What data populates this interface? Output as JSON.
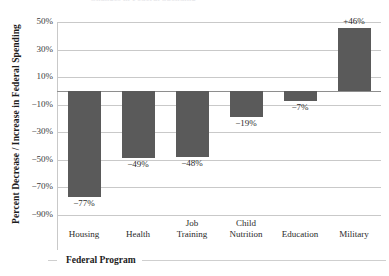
{
  "figure": {
    "cut_title_sliver": "Changes in Federal Spending",
    "background_color": "#ffffff",
    "bar_color": "#5a5a5a",
    "gridline_color": "#c9c9c9",
    "zero_line_color": "#8e8e8e"
  },
  "chart_data": {
    "type": "bar",
    "title": "",
    "xlabel": "Federal Program",
    "ylabel": "Percent Decrease / Increase in Federal Spending",
    "categories": [
      "Housing",
      "Health",
      "Job Training",
      "Child Nutrition",
      "Education",
      "Military"
    ],
    "values": [
      -77,
      -49,
      -48,
      -19,
      -7,
      46
    ],
    "data_labels": [
      "−77%",
      "−49%",
      "−48%",
      "−19%",
      "−7%",
      "+46%"
    ],
    "ylim": [
      -90,
      50
    ],
    "ytick_values": [
      50,
      30,
      10,
      -10,
      -30,
      -50,
      -70,
      -90
    ],
    "ytick_labels": [
      "50%",
      "30%",
      "10%",
      "−10%",
      "−30%",
      "−50%",
      "−70%",
      "−90%"
    ],
    "grid": true,
    "grid_axis": "y",
    "legend": false,
    "zero_line": 0,
    "units": "percent"
  }
}
